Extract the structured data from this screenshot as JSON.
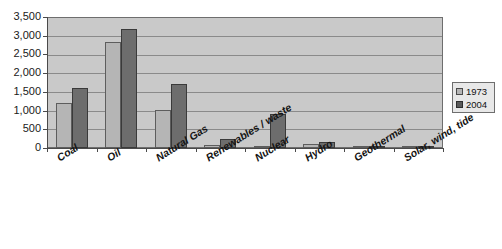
{
  "chart_data": {
    "type": "bar",
    "title": "",
    "subtitle": "",
    "xlabel": "",
    "ylabel": "",
    "ylim": [
      0,
      3500
    ],
    "ytick_values": [
      0,
      500,
      1000,
      1500,
      2000,
      2500,
      3000,
      3500
    ],
    "ytick_labels": [
      "0",
      "500",
      "1,000",
      "1,500",
      "2,000",
      "2,500",
      "3,000",
      "3,500"
    ],
    "grid": true,
    "legend_position": "right",
    "categories": [
      "Coal",
      "Oil",
      "Natural Gas",
      "Renewables / waste",
      "Nuclear",
      "Hydro",
      "Geothermal",
      "Solar, wind, tide"
    ],
    "series": [
      {
        "name": "1973",
        "color": "#b5b5b5",
        "values": [
          1200,
          2830,
          1010,
          80,
          50,
          110,
          5,
          2
        ]
      },
      {
        "name": "2004",
        "color": "#6d6d6d",
        "values": [
          1600,
          3190,
          1700,
          230,
          900,
          150,
          25,
          20
        ]
      }
    ]
  },
  "legend": {
    "items": [
      {
        "label": "1973",
        "swatch": "legend-swatch-1973"
      },
      {
        "label": "2004",
        "swatch": "legend-swatch-2004"
      }
    ]
  },
  "colors": {
    "plot_background": "#c9c9c9",
    "gridline": "#8a8a8a",
    "axis": "#4a4a4a",
    "series_1973": "#b5b5b5",
    "series_2004": "#6d6d6d",
    "legend_background": "#e8e8e8"
  }
}
